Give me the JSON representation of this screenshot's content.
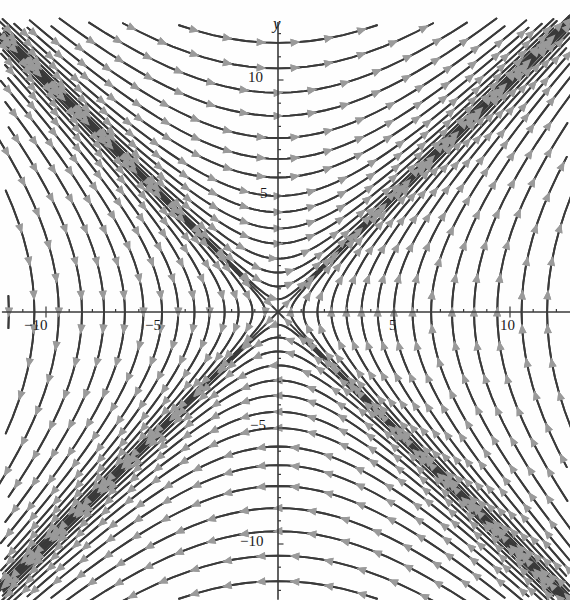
{
  "figure": {
    "kind": "direction-field-phase-portrait",
    "background_color": "#fefefe",
    "curve_color": "#3a3a3a",
    "arrow_color": "#9a9a9a",
    "axis_color": "#3a3a3a"
  },
  "axes": {
    "x_axis_label": "x",
    "y_axis_label": "y",
    "origin_px": {
      "x": 278,
      "y": 312
    },
    "scale_px_per_unit": 23.2,
    "xlim": [
      -11.9,
      12.6
    ],
    "ylim": [
      -12.4,
      12.5
    ],
    "x_major_ticks": [
      -10,
      -5,
      5,
      10
    ],
    "y_major_ticks": [
      10,
      5,
      -5,
      -10
    ],
    "x_minor_tick_step": 1,
    "y_minor_tick_step": 1,
    "x_tick_labels": [
      "−10",
      "−5",
      "5",
      "10"
    ],
    "y_tick_labels": [
      "10",
      "5",
      "−5",
      "−10"
    ],
    "grid": false,
    "frame": false
  },
  "chart_data": {
    "type": "line",
    "title": "",
    "xlabel": "x",
    "ylabel": "y",
    "xlim": [
      -11.9,
      12.6
    ],
    "ylim": [
      -12.4,
      12.5
    ],
    "grid": false,
    "legend": "none",
    "system": {
      "dx_dt": "y",
      "dy_dt": "x",
      "equilibrium": [
        0,
        0
      ],
      "equilibrium_type": "saddle",
      "trajectory_family": "x^2 - y^2 = C",
      "separatrices": [
        "y = x",
        "y = -x"
      ],
      "eigenvalues": [
        1,
        -1
      ],
      "eigenvectors": [
        [
          1,
          1
        ],
        [
          1,
          -1
        ]
      ]
    },
    "level_constants_C": [
      -144,
      -121,
      -100,
      -81,
      -64,
      -49,
      -36,
      -25,
      -16,
      -9,
      -4,
      -1,
      0,
      1,
      4,
      9,
      16,
      25,
      36,
      49,
      64,
      81,
      100,
      121,
      144
    ],
    "flow_direction_samples": [
      {
        "x": 0,
        "y": 10,
        "u": 10,
        "v": 0,
        "reads": "right"
      },
      {
        "x": 0,
        "y": -10,
        "u": -10,
        "v": 0,
        "reads": "left"
      },
      {
        "x": 10,
        "y": 0,
        "u": 0,
        "v": 10,
        "reads": "up"
      },
      {
        "x": -10,
        "y": 0,
        "u": 0,
        "v": -10,
        "reads": "down"
      },
      {
        "x": 8,
        "y": 8,
        "u": 8,
        "v": 8,
        "reads": "up-right"
      },
      {
        "x": -8,
        "y": -8,
        "u": -8,
        "v": -8,
        "reads": "down-left"
      },
      {
        "x": -8,
        "y": 8,
        "u": 8,
        "v": -8,
        "reads": "down-right"
      },
      {
        "x": 8,
        "y": -8,
        "u": -8,
        "v": 8,
        "reads": "up-left"
      }
    ]
  }
}
